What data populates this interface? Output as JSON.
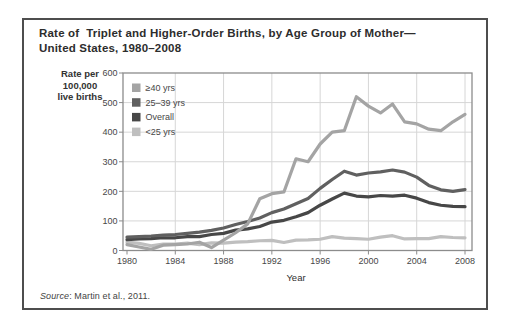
{
  "figure": {
    "title_line1": "Rate of  Triplet and Higher-Order Births, by Age Group of Mother—",
    "title_line2": "United States, 1980–2008",
    "y_unit_label": [
      "Rate per",
      "100,000",
      "live births"
    ],
    "x_axis_label": "Year",
    "source_italic": "Source",
    "source_text": ": Martin et al., 2011."
  },
  "colors": {
    "figure_border": "#4e4e4e",
    "plot_border": "#8c8c8c",
    "gridline": "#d6d6d6",
    "tick_label": "#474747"
  },
  "chart_data": {
    "type": "line",
    "xlabel": "Year",
    "ylabel": "Rate per 100,000 live births",
    "xlim": [
      1980,
      2008
    ],
    "ylim": [
      0,
      600
    ],
    "x_ticks": [
      1980,
      1984,
      1988,
      1992,
      1996,
      2000,
      2004,
      2008
    ],
    "y_ticks": [
      0,
      100,
      200,
      300,
      400,
      500,
      600
    ],
    "grid": true,
    "legend_position": "top-left",
    "x": [
      1980,
      1981,
      1982,
      1983,
      1984,
      1985,
      1986,
      1987,
      1988,
      1989,
      1990,
      1991,
      1992,
      1993,
      1994,
      1995,
      1996,
      1997,
      1998,
      1999,
      2000,
      2001,
      2002,
      2003,
      2004,
      2005,
      2006,
      2007,
      2008
    ],
    "series": [
      {
        "name": "≥40 yrs",
        "color": "#a4a4a4",
        "values": [
          20,
          12,
          4,
          18,
          20,
          22,
          28,
          10,
          35,
          60,
          90,
          175,
          192,
          198,
          310,
          300,
          360,
          400,
          405,
          520,
          488,
          465,
          495,
          435,
          428,
          410,
          405,
          435,
          460
        ]
      },
      {
        "name": "25–39 yrs",
        "color": "#606060",
        "values": [
          45,
          47,
          49,
          52,
          54,
          58,
          62,
          68,
          76,
          88,
          98,
          110,
          128,
          140,
          158,
          176,
          210,
          240,
          268,
          255,
          262,
          266,
          272,
          265,
          248,
          220,
          205,
          200,
          206
        ]
      },
      {
        "name": "Overall",
        "color": "#474747",
        "values": [
          37,
          39,
          40,
          43,
          43,
          47,
          47,
          54,
          58,
          69,
          73,
          81,
          96,
          102,
          114,
          128,
          153,
          174,
          194,
          184,
          181,
          186,
          184,
          187,
          177,
          162,
          153,
          149,
          148
        ]
      },
      {
        "name": "<25 yrs",
        "color": "#bfbfbf",
        "values": [
          28,
          24,
          16,
          22,
          22,
          25,
          20,
          26,
          25,
          28,
          30,
          33,
          34,
          27,
          35,
          36,
          38,
          47,
          42,
          40,
          38,
          45,
          50,
          39,
          40,
          40,
          47,
          44,
          43
        ]
      }
    ],
    "draw_order": [
      3,
      2,
      1,
      0
    ]
  }
}
